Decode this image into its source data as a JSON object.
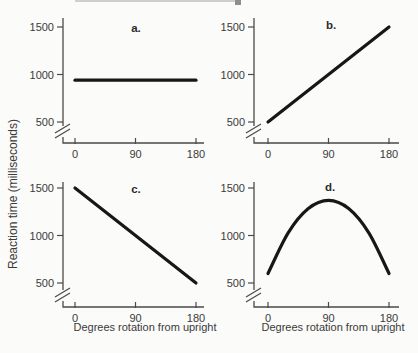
{
  "figure": {
    "y_axis_label": "Reaction time (milliseconds)",
    "x_axis_label": "Degrees rotation from upright",
    "background_color": "#fbfbf9",
    "axis_color": "#4a4a4a",
    "data_line_color": "#171717",
    "text_color": "#3a3a3a"
  },
  "chart_data": [
    {
      "id": "a",
      "label": "a.",
      "type": "line",
      "x": [
        0,
        180
      ],
      "values": [
        940,
        940
      ],
      "smooth": false,
      "x_ticks": [
        "0",
        "90",
        "180"
      ],
      "y_ticks": [
        "500",
        "1000",
        "1500"
      ],
      "xlim": [
        0,
        180
      ],
      "ylim": [
        500,
        1500
      ],
      "axis_break_below_500": true,
      "xlabel": "Degrees rotation from upright",
      "ylabel": "Reaction time (milliseconds)",
      "description": "flat line at about 940 ms"
    },
    {
      "id": "b",
      "label": "b.",
      "type": "line",
      "x": [
        0,
        180
      ],
      "values": [
        500,
        1500
      ],
      "smooth": false,
      "x_ticks": [
        "0",
        "90",
        "180"
      ],
      "y_ticks": [
        "500",
        "1000",
        "1500"
      ],
      "xlim": [
        0,
        180
      ],
      "ylim": [
        500,
        1500
      ],
      "axis_break_below_500": true,
      "xlabel": "Degrees rotation from upright",
      "ylabel": "Reaction time (milliseconds)",
      "description": "linear increase from 500 ms to 1500 ms"
    },
    {
      "id": "c",
      "label": "c.",
      "type": "line",
      "x": [
        0,
        180
      ],
      "values": [
        1500,
        500
      ],
      "smooth": false,
      "x_ticks": [
        "0",
        "90",
        "180"
      ],
      "y_ticks": [
        "500",
        "1000",
        "1500"
      ],
      "xlim": [
        0,
        180
      ],
      "ylim": [
        500,
        1500
      ],
      "axis_break_below_500": true,
      "xlabel": "Degrees rotation from upright",
      "ylabel": "Reaction time (milliseconds)",
      "description": "linear decrease from 1500 ms to 500 ms"
    },
    {
      "id": "d",
      "label": "d.",
      "type": "line",
      "x": [
        0,
        30,
        60,
        90,
        120,
        150,
        180
      ],
      "values": [
        600,
        1028,
        1284,
        1370,
        1284,
        1028,
        600
      ],
      "smooth": true,
      "x_ticks": [
        "0",
        "90",
        "180"
      ],
      "y_ticks": [
        "500",
        "1000",
        "1500"
      ],
      "xlim": [
        0,
        180
      ],
      "ylim": [
        500,
        1500
      ],
      "axis_break_below_500": true,
      "xlabel": "Degrees rotation from upright",
      "ylabel": "Reaction time (milliseconds)",
      "description": "inverted-U curve peaking near 1370 ms at 90 degrees"
    }
  ]
}
